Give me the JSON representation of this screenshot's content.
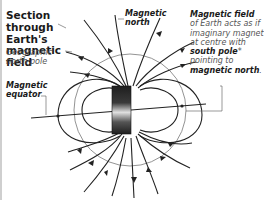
{
  "title": "Section through Earth's magnetic field",
  "labels": {
    "geographic_north_pole": "Geographic north pole",
    "magnetic_equator": "Magnetic equator",
    "magnetic_north": "Magnetic north"
  },
  "field_note": {
    "heading": "Magnetic field",
    "line1": "of Earth acts as if imaginary magnet at centre with",
    "south_pole": "south pole",
    "asterisk": "*",
    "line2": "pointing to",
    "magnetic_north": "magnetic north",
    "period": "."
  },
  "colors": {
    "line": "#222222",
    "earth_outline": "#777777",
    "magnet_dark": "#2a2a2a",
    "magnet_light": "#d8d8d8",
    "text_body": "#555555",
    "text_bold": "#1a1a1a",
    "border": "#cfcfcf"
  }
}
